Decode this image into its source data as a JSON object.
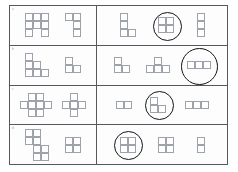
{
  "page": {
    "background": "#ffffff",
    "frame_color": "#55585c",
    "cell_stroke": "#9ea3ab",
    "circle_color": "#121416",
    "cell_size": 8
  },
  "rows": [
    {
      "badge": "a",
      "left_shapes": [
        {
          "name": "square-3x3-minus-bottom-center",
          "cells": [
            [
              0,
              0
            ],
            [
              1,
              0
            ],
            [
              2,
              0
            ],
            [
              0,
              1
            ],
            [
              1,
              1
            ],
            [
              2,
              1
            ],
            [
              0,
              2
            ],
            [
              2,
              2
            ]
          ],
          "circled": false
        },
        {
          "name": "j-tetromino",
          "cells": [
            [
              0,
              0
            ],
            [
              1,
              0
            ],
            [
              1,
              1
            ],
            [
              1,
              2
            ]
          ],
          "circled": false
        }
      ],
      "right_shapes": [
        {
          "name": "l-tetromino",
          "cells": [
            [
              0,
              0
            ],
            [
              0,
              1
            ],
            [
              0,
              2
            ],
            [
              1,
              2
            ]
          ],
          "circled": false
        },
        {
          "name": "square-2x2",
          "cells": [
            [
              0,
              0
            ],
            [
              1,
              0
            ],
            [
              0,
              1
            ],
            [
              1,
              1
            ]
          ],
          "circled": true
        },
        {
          "name": "vertical-i-tromino",
          "cells": [
            [
              0,
              0
            ],
            [
              0,
              1
            ],
            [
              0,
              2
            ]
          ],
          "circled": false
        }
      ]
    },
    {
      "badge": "b",
      "left_shapes": [
        {
          "name": "staircase-hexomino",
          "cells": [
            [
              0,
              0
            ],
            [
              0,
              1
            ],
            [
              1,
              1
            ],
            [
              0,
              2
            ],
            [
              1,
              2
            ],
            [
              2,
              2
            ]
          ],
          "circled": false
        },
        {
          "name": "s-tetromino",
          "cells": [
            [
              0,
              0
            ],
            [
              0,
              1
            ],
            [
              1,
              1
            ]
          ],
          "circled": false
        }
      ],
      "right_shapes": [
        {
          "name": "s-tetromino",
          "cells": [
            [
              0,
              0
            ],
            [
              0,
              1
            ],
            [
              1,
              1
            ]
          ],
          "circled": false
        },
        {
          "name": "t-tetromino",
          "cells": [
            [
              1,
              0
            ],
            [
              0,
              1
            ],
            [
              1,
              1
            ],
            [
              2,
              1
            ]
          ],
          "circled": false
        },
        {
          "name": "horizontal-i-tromino",
          "cells": [
            [
              0,
              0
            ],
            [
              1,
              0
            ],
            [
              2,
              0
            ]
          ],
          "circled": true
        }
      ]
    },
    {
      "badge": "c",
      "left_shapes": [
        {
          "name": "cross-hexomino",
          "cells": [
            [
              1,
              0
            ],
            [
              2,
              0
            ],
            [
              0,
              1
            ],
            [
              1,
              1
            ],
            [
              2,
              1
            ],
            [
              3,
              1
            ],
            [
              1,
              2
            ],
            [
              2,
              2
            ]
          ],
          "circled": false
        },
        {
          "name": "plus-pentomino",
          "cells": [
            [
              1,
              0
            ],
            [
              0,
              1
            ],
            [
              1,
              1
            ],
            [
              2,
              1
            ],
            [
              1,
              2
            ]
          ],
          "circled": false
        }
      ],
      "right_shapes": [
        {
          "name": "domino",
          "cells": [
            [
              0,
              0
            ],
            [
              1,
              0
            ]
          ],
          "circled": false
        },
        {
          "name": "l-tromino",
          "cells": [
            [
              0,
              0
            ],
            [
              0,
              1
            ],
            [
              1,
              1
            ]
          ],
          "circled": true
        },
        {
          "name": "horizontal-i-tromino",
          "cells": [
            [
              0,
              0
            ],
            [
              1,
              0
            ],
            [
              2,
              0
            ]
          ],
          "circled": false
        }
      ]
    },
    {
      "badge": "d",
      "left_shapes": [
        {
          "name": "offset-double-square",
          "cells": [
            [
              0,
              0
            ],
            [
              1,
              0
            ],
            [
              0,
              1
            ],
            [
              1,
              1
            ],
            [
              1,
              2
            ],
            [
              2,
              2
            ],
            [
              1,
              3
            ],
            [
              2,
              3
            ]
          ],
          "circled": false
        },
        {
          "name": "square-2x2",
          "cells": [
            [
              0,
              0
            ],
            [
              1,
              0
            ],
            [
              0,
              1
            ],
            [
              1,
              1
            ]
          ],
          "circled": false
        }
      ],
      "right_shapes": [
        {
          "name": "square-2x2",
          "cells": [
            [
              0,
              0
            ],
            [
              1,
              0
            ],
            [
              0,
              1
            ],
            [
              1,
              1
            ]
          ],
          "circled": true
        },
        {
          "name": "square-2x2",
          "cells": [
            [
              0,
              0
            ],
            [
              1,
              0
            ],
            [
              0,
              1
            ],
            [
              1,
              1
            ]
          ],
          "circled": false
        },
        {
          "name": "vertical-domino",
          "cells": [
            [
              0,
              0
            ],
            [
              0,
              1
            ]
          ],
          "circled": false
        }
      ]
    }
  ]
}
